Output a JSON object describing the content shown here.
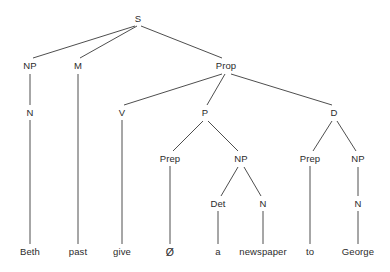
{
  "diagram": {
    "type": "syntax-tree",
    "sentence": "Beth past give Ø a newspaper to George",
    "line_color": "#3a3a3a",
    "text_color": "#2b2b2b",
    "background_color": "#ffffff",
    "nodes": [
      {
        "id": "S",
        "label": "S",
        "x": 138,
        "y": 19,
        "kind": "nonterminal"
      },
      {
        "id": "NP1",
        "label": "NP",
        "x": 30,
        "y": 66,
        "kind": "nonterminal"
      },
      {
        "id": "M",
        "label": "M",
        "x": 78,
        "y": 66,
        "kind": "nonterminal"
      },
      {
        "id": "Prop",
        "label": "Prop",
        "x": 226,
        "y": 66,
        "kind": "nonterminal"
      },
      {
        "id": "N1",
        "label": "N",
        "x": 30,
        "y": 113,
        "kind": "nonterminal"
      },
      {
        "id": "V",
        "label": "V",
        "x": 122,
        "y": 113,
        "kind": "nonterminal"
      },
      {
        "id": "P",
        "label": "P",
        "x": 205,
        "y": 113,
        "kind": "nonterminal"
      },
      {
        "id": "D",
        "label": "D",
        "x": 334,
        "y": 113,
        "kind": "nonterminal"
      },
      {
        "id": "Prep1",
        "label": "Prep",
        "x": 170,
        "y": 159,
        "kind": "nonterminal"
      },
      {
        "id": "NP2",
        "label": "NP",
        "x": 241,
        "y": 159,
        "kind": "nonterminal"
      },
      {
        "id": "Prep2",
        "label": "Prep",
        "x": 310,
        "y": 159,
        "kind": "nonterminal"
      },
      {
        "id": "NP3",
        "label": "NP",
        "x": 358,
        "y": 159,
        "kind": "nonterminal"
      },
      {
        "id": "Det",
        "label": "Det",
        "x": 218,
        "y": 204,
        "kind": "nonterminal"
      },
      {
        "id": "N2",
        "label": "N",
        "x": 263,
        "y": 204,
        "kind": "nonterminal"
      },
      {
        "id": "N3",
        "label": "N",
        "x": 358,
        "y": 204,
        "kind": "nonterminal"
      },
      {
        "id": "w_beth",
        "label": "Beth",
        "x": 30,
        "y": 252,
        "kind": "terminal"
      },
      {
        "id": "w_past",
        "label": "past",
        "x": 78,
        "y": 252,
        "kind": "terminal"
      },
      {
        "id": "w_give",
        "label": "give",
        "x": 122,
        "y": 252,
        "kind": "terminal"
      },
      {
        "id": "w_null",
        "label": "Ø",
        "x": 170,
        "y": 252,
        "kind": "terminal-null"
      },
      {
        "id": "w_a",
        "label": "a",
        "x": 218,
        "y": 252,
        "kind": "terminal"
      },
      {
        "id": "w_news",
        "label": "newspaper",
        "x": 263,
        "y": 252,
        "kind": "terminal"
      },
      {
        "id": "w_to",
        "label": "to",
        "x": 310,
        "y": 252,
        "kind": "terminal"
      },
      {
        "id": "w_george",
        "label": "George",
        "x": 358,
        "y": 252,
        "kind": "terminal"
      }
    ],
    "edges": [
      {
        "from": "S",
        "to": "NP1",
        "x1": 135,
        "y1": 26,
        "x2": 33,
        "y2": 58
      },
      {
        "from": "S",
        "to": "M",
        "x1": 137,
        "y1": 26,
        "x2": 80,
        "y2": 58
      },
      {
        "from": "S",
        "to": "Prop",
        "x1": 141,
        "y1": 26,
        "x2": 222,
        "y2": 58
      },
      {
        "from": "NP1",
        "to": "N1",
        "x1": 30,
        "y1": 74,
        "x2": 30,
        "y2": 105
      },
      {
        "from": "M",
        "to": "w_past",
        "x1": 78,
        "y1": 74,
        "x2": 78,
        "y2": 244
      },
      {
        "from": "Prop",
        "to": "V",
        "x1": 222,
        "y1": 74,
        "x2": 124,
        "y2": 105
      },
      {
        "from": "Prop",
        "to": "P",
        "x1": 225,
        "y1": 74,
        "x2": 207,
        "y2": 105
      },
      {
        "from": "Prop",
        "to": "D",
        "x1": 231,
        "y1": 74,
        "x2": 332,
        "y2": 105
      },
      {
        "from": "N1",
        "to": "w_beth",
        "x1": 30,
        "y1": 120,
        "x2": 30,
        "y2": 244
      },
      {
        "from": "V",
        "to": "w_give",
        "x1": 122,
        "y1": 120,
        "x2": 122,
        "y2": 244
      },
      {
        "from": "P",
        "to": "Prep1",
        "x1": 203,
        "y1": 121,
        "x2": 173,
        "y2": 151
      },
      {
        "from": "P",
        "to": "NP2",
        "x1": 208,
        "y1": 121,
        "x2": 238,
        "y2": 151
      },
      {
        "from": "D",
        "to": "Prep2",
        "x1": 332,
        "y1": 121,
        "x2": 313,
        "y2": 151
      },
      {
        "from": "D",
        "to": "NP3",
        "x1": 337,
        "y1": 121,
        "x2": 356,
        "y2": 151
      },
      {
        "from": "Prep1",
        "to": "w_null",
        "x1": 170,
        "y1": 166,
        "x2": 170,
        "y2": 244
      },
      {
        "from": "NP2",
        "to": "Det",
        "x1": 238,
        "y1": 167,
        "x2": 221,
        "y2": 196
      },
      {
        "from": "NP2",
        "to": "N2",
        "x1": 244,
        "y1": 167,
        "x2": 261,
        "y2": 196
      },
      {
        "from": "Prep2",
        "to": "w_to",
        "x1": 310,
        "y1": 166,
        "x2": 310,
        "y2": 244
      },
      {
        "from": "NP3",
        "to": "N3",
        "x1": 358,
        "y1": 167,
        "x2": 358,
        "y2": 196
      },
      {
        "from": "Det",
        "to": "w_a",
        "x1": 218,
        "y1": 211,
        "x2": 218,
        "y2": 244
      },
      {
        "from": "N2",
        "to": "w_news",
        "x1": 263,
        "y1": 211,
        "x2": 263,
        "y2": 244
      },
      {
        "from": "N3",
        "to": "w_george",
        "x1": 358,
        "y1": 211,
        "x2": 358,
        "y2": 244
      }
    ]
  }
}
